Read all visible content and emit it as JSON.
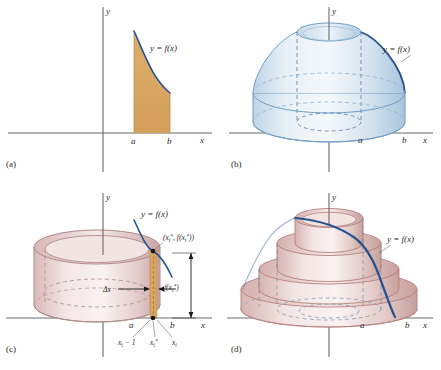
{
  "figure": {
    "panels": [
      {
        "id": "a",
        "label": "(a)",
        "caption": "Region under y = f(x) between x = a and x = b",
        "axis_x_label": "x",
        "axis_y_label": "y",
        "curve_label": "y = f(x)",
        "tick_a": "a",
        "tick_b": "b",
        "region_fill": "#d9a761",
        "curve_color": "#27528f"
      },
      {
        "id": "b",
        "label": "(b)",
        "caption": "Solid generated by revolving the region about the y-axis",
        "axis_x_label": "x",
        "axis_y_label": "y",
        "curve_label": "y = f(x)",
        "tick_a": "a",
        "tick_b": "b",
        "solid_fill": "#cfe0ef",
        "solid_edge": "#6e9ec6",
        "curve_color": "#27528f"
      },
      {
        "id": "c",
        "label": "(c)",
        "caption": "A single cylindrical shell of thickness delta x and height f(xi*)",
        "axis_x_label": "x",
        "axis_y_label": "y",
        "curve_label": "y = f(x)",
        "tick_a": "a",
        "tick_b": "b",
        "point_label": "(x",
        "point_label_sub1": "i",
        "point_label_star1": "*",
        "point_label_mid": ", f(x",
        "point_label_sub2": "i",
        "point_label_star2": "*",
        "point_label_end": "))",
        "delta_x_label": "Δx",
        "height_label_pre": "f(x",
        "height_label_sub": "i",
        "height_label_star": "*",
        "height_label_post": ")",
        "partition_left_pre": "x",
        "partition_left_sub": "i",
        "partition_left_post": " − 1",
        "partition_star_pre": "x",
        "partition_star_sub": "i",
        "partition_star_post": "*",
        "partition_right_pre": "x",
        "partition_right_sub": "i",
        "shell_fill": "#e8d5d5",
        "shell_edge": "#b08a8a",
        "strip_fill": "#d9a761",
        "curve_color": "#27528f"
      },
      {
        "id": "d",
        "label": "(d)",
        "caption": "Approximation of the solid by nested cylindrical shells",
        "axis_x_label": "x",
        "axis_y_label": "y",
        "curve_label": "y = f(x)",
        "tick_a": "a",
        "tick_b": "b",
        "shell_fill": "#e6d2d0",
        "shell_edge": "#b5807c",
        "curve_color": "#27528f",
        "shell_count": 4
      }
    ]
  }
}
